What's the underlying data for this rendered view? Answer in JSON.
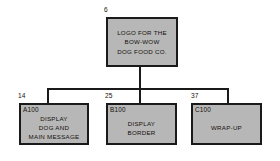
{
  "diagram": {
    "fill_color": "#b7b7b7",
    "line_color": "#1a1a1a",
    "background": "#ffffff",
    "root": {
      "number": "6",
      "code": "",
      "lines": [
        "LOGO FOR THE",
        "BOW-WOW",
        "DOG FOOD CO."
      ]
    },
    "children": [
      {
        "number": "14",
        "code": "A100",
        "lines": [
          "DISPLAY",
          "DOG AND",
          "MAIN MESSAGE"
        ]
      },
      {
        "number": "25",
        "code": "B100",
        "lines": [
          "DISPLAY",
          "BORDER"
        ]
      },
      {
        "number": "37",
        "code": "C100",
        "lines": [
          "WRAP-UP"
        ]
      }
    ]
  }
}
